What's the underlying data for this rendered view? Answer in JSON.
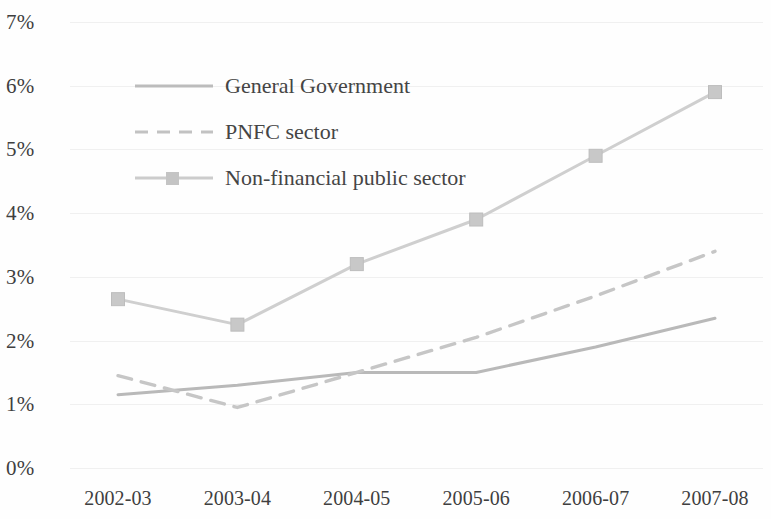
{
  "chart_data": {
    "type": "line",
    "title": "",
    "subtitle": "",
    "xlabel": "",
    "ylabel": "",
    "categories": [
      "2002-03",
      "2003-04",
      "2004-05",
      "2005-06",
      "2006-07",
      "2007-08"
    ],
    "y_tick_labels": [
      "0%",
      "1%",
      "2%",
      "3%",
      "4%",
      "5%",
      "6%",
      "7%"
    ],
    "y_tick_values": [
      0,
      1,
      2,
      3,
      4,
      5,
      6,
      7
    ],
    "ylim": [
      0,
      7
    ],
    "grid": true,
    "legend_position": "upper-left-inside",
    "series": [
      {
        "name": "General Government",
        "style": "solid",
        "marker": "none",
        "color": "#b9b9b9",
        "values": [
          1.15,
          1.3,
          1.5,
          1.5,
          1.9,
          2.35
        ]
      },
      {
        "name": "PNFC sector",
        "style": "dashed",
        "marker": "none",
        "color": "#c6c6c6",
        "values": [
          1.45,
          0.95,
          1.5,
          2.05,
          2.7,
          3.4
        ]
      },
      {
        "name": "Non-financial public sector",
        "style": "solid",
        "marker": "square",
        "color": "#cfcfcf",
        "values": [
          2.65,
          2.25,
          3.2,
          3.9,
          4.9,
          5.9
        ]
      }
    ]
  },
  "legend": {
    "items": [
      {
        "label": "General Government"
      },
      {
        "label": "PNFC sector"
      },
      {
        "label": "Non-financial public sector"
      }
    ]
  },
  "axes": {
    "y_labels": [
      "7%",
      "6%",
      "5%",
      "4%",
      "3%",
      "2%",
      "1%",
      "0%"
    ],
    "x_labels": [
      "2002-03",
      "2003-04",
      "2004-05",
      "2005-06",
      "2006-07",
      "2007-08"
    ]
  },
  "colors": {
    "general_government": "#b9b9b9",
    "pnfc_sector": "#c6c6c6",
    "non_financial_public_sector": "#cfcfcf",
    "grid": "#f0f0f0",
    "text": "#3f3f3f",
    "background": "#fefefe"
  }
}
